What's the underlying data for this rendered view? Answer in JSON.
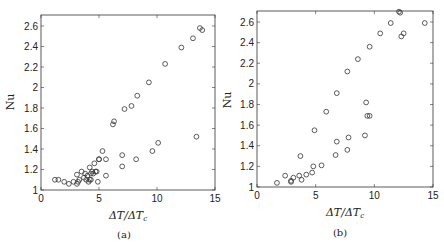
{
  "chart_data": [
    {
      "type": "scatter",
      "panel": "a",
      "caption": "(a)",
      "title": "",
      "xlabel": "ΔT/ΔTc",
      "ylabel": "Nu",
      "xlim": [
        0,
        15
      ],
      "ylim": [
        1,
        2.7
      ],
      "xticks": [
        0,
        5,
        10,
        15
      ],
      "yticks": [
        1,
        1.2,
        1.4,
        1.6,
        1.8,
        2,
        2.2,
        2.4,
        2.6
      ],
      "grid": false,
      "marker": "open-circle",
      "x": [
        1.2,
        1.5,
        2.0,
        2.4,
        2.8,
        3.1,
        3.1,
        3.2,
        3.3,
        3.5,
        3.7,
        3.8,
        3.9,
        4.0,
        4.1,
        4.2,
        4.2,
        4.3,
        4.3,
        4.4,
        4.5,
        4.6,
        4.7,
        4.8,
        4.9,
        5.0,
        5.0,
        5.3,
        5.6,
        5.6,
        6.2,
        6.3,
        7.0,
        7.0,
        7.2,
        7.8,
        8.2,
        8.3,
        9.3,
        9.6,
        10.1,
        10.7,
        12.1,
        13.1,
        13.4,
        13.7,
        13.9
      ],
      "y": [
        1.1,
        1.1,
        1.08,
        1.06,
        1.08,
        1.06,
        1.15,
        1.08,
        1.1,
        1.18,
        1.12,
        1.16,
        1.1,
        1.14,
        1.08,
        1.1,
        1.22,
        1.16,
        1.1,
        1.18,
        1.16,
        1.26,
        1.18,
        1.18,
        1.08,
        1.3,
        1.3,
        1.38,
        1.3,
        1.14,
        1.64,
        1.67,
        1.34,
        1.23,
        1.79,
        1.82,
        1.3,
        1.92,
        2.05,
        1.38,
        1.46,
        2.23,
        2.39,
        2.48,
        1.52,
        2.58,
        2.56
      ]
    },
    {
      "type": "scatter",
      "panel": "b",
      "caption": "(b)",
      "title": "",
      "xlabel": "ΔT/ΔTc",
      "ylabel": "Nu",
      "xlim": [
        0,
        15
      ],
      "ylim": [
        1,
        2.7
      ],
      "xticks": [
        0,
        5,
        10,
        15
      ],
      "yticks": [
        1,
        1.2,
        1.4,
        1.6,
        1.8,
        2,
        2.2,
        2.4,
        2.6
      ],
      "grid": false,
      "marker": "open-circle",
      "x": [
        1.7,
        2.4,
        2.9,
        2.9,
        3.1,
        3.6,
        3.7,
        3.8,
        4.2,
        4.7,
        4.8,
        4.9,
        5.5,
        5.9,
        6.7,
        6.8,
        6.8,
        7.7,
        7.7,
        7.8,
        8.6,
        9.2,
        9.3,
        9.4,
        9.6,
        9.6,
        10.5,
        11.4,
        12.1,
        12.2,
        12.3,
        12.5,
        14.3
      ],
      "y": [
        1.04,
        1.11,
        1.05,
        1.06,
        1.09,
        1.11,
        1.3,
        1.07,
        1.12,
        1.14,
        1.2,
        1.55,
        1.21,
        1.73,
        1.31,
        1.44,
        1.91,
        1.36,
        2.12,
        1.48,
        2.24,
        1.5,
        1.82,
        1.69,
        2.36,
        1.69,
        2.49,
        2.59,
        2.7,
        2.69,
        2.46,
        2.49,
        2.59
      ]
    }
  ],
  "panels": {
    "a": {
      "caption": "(a)",
      "ylabel": "Nu",
      "xlabel_main": "ΔT/ΔT",
      "xlabel_sub": "c"
    },
    "b": {
      "caption": "(b)",
      "ylabel": "Nu",
      "xlabel_main": "ΔT/ΔT",
      "xlabel_sub": "c"
    }
  }
}
